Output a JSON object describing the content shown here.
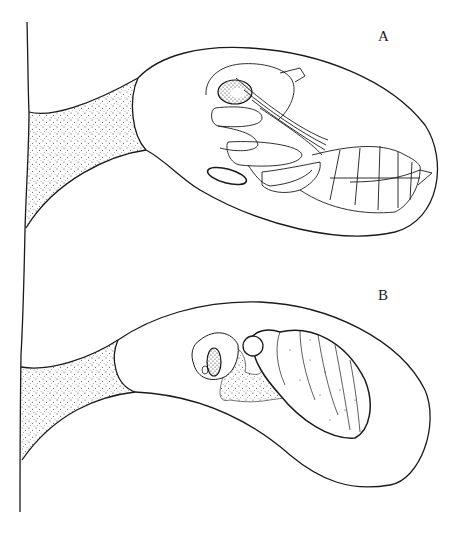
{
  "figure": {
    "panels": [
      {
        "id": "A",
        "label": "A",
        "description": "Pupa within cell attached to stem"
      },
      {
        "id": "B",
        "label": "B",
        "description": "Larva within cell attached to stem"
      }
    ],
    "colors": {
      "ink": "#1a1a1a",
      "background": "#ffffff",
      "stipple": "#333333"
    }
  }
}
